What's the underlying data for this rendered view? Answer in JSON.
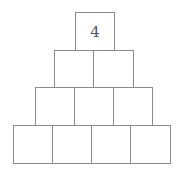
{
  "pyramid": {
    "rows": [
      {
        "cells": [
          {
            "value": "4"
          }
        ]
      },
      {
        "cells": [
          {
            "value": ""
          },
          {
            "value": ""
          }
        ]
      },
      {
        "cells": [
          {
            "value": ""
          },
          {
            "value": ""
          },
          {
            "value": ""
          }
        ]
      },
      {
        "cells": [
          {
            "value": ""
          },
          {
            "value": ""
          },
          {
            "value": ""
          },
          {
            "value": ""
          }
        ]
      }
    ]
  }
}
